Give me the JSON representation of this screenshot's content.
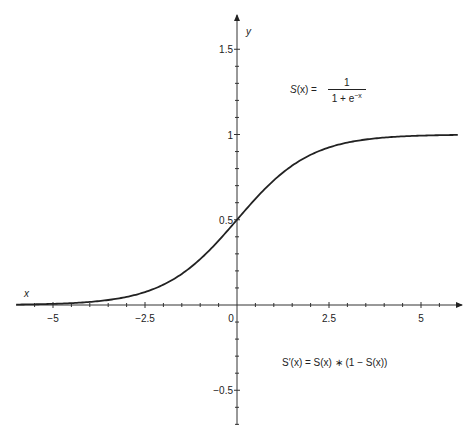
{
  "chart_data": {
    "type": "line",
    "title": "",
    "xlabel": "x",
    "ylabel": "y",
    "xlim": [
      -6,
      6
    ],
    "ylim": [
      -0.7,
      1.65
    ],
    "grid": false,
    "legend": "none",
    "x_ticks": [
      -5,
      -2.5,
      0,
      2.5,
      5
    ],
    "x_tick_labels": [
      "−5",
      "−2.5",
      "0",
      "2.5",
      "5"
    ],
    "y_ticks": [
      -0.5,
      0.5,
      1,
      1.5
    ],
    "y_tick_labels": [
      "−0.5",
      "0.5",
      "1",
      "1.5"
    ],
    "x_minor_tick_step": 0.5,
    "y_minor_tick_step": 0.1,
    "series": [
      {
        "name": "S(x)",
        "color": "#222222",
        "x": [
          -6,
          -5,
          -4,
          -3,
          -2.5,
          -2,
          -1.5,
          -1,
          -0.5,
          0,
          0.5,
          1,
          1.5,
          2,
          2.5,
          3,
          4,
          5,
          6
        ],
        "values": [
          0.0025,
          0.0067,
          0.018,
          0.047,
          0.076,
          0.119,
          0.182,
          0.269,
          0.378,
          0.5,
          0.622,
          0.731,
          0.818,
          0.881,
          0.924,
          0.953,
          0.982,
          0.993,
          0.9975
        ]
      }
    ],
    "annotations": [
      {
        "text": "S(x) = 1 / (1 + e^−x)",
        "x": 2.5,
        "y": 1.25
      },
      {
        "text": "S′(x) = S(x) ∗ (1 − S(x))",
        "x": 2.5,
        "y": -0.35
      }
    ]
  },
  "labels": {
    "x_axis": "x",
    "y_axis": "y",
    "origin": "0"
  },
  "formulas": {
    "sigmoid": {
      "lhs_fn": "S",
      "lhs_arg": "(x)",
      "equals": " = ",
      "numerator": "1",
      "denominator_base": "1 + e",
      "denominator_exp": "−x"
    },
    "derivative": {
      "text": "S′(x) = S(x) ∗ (1 − S(x))"
    }
  }
}
